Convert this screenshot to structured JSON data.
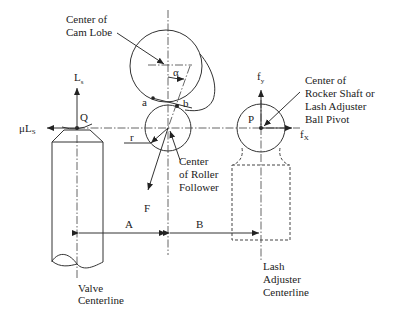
{
  "diagram": {
    "type": "rocker arm / roller follower valvetrain force diagram",
    "labels": {
      "cam_center": [
        "Center of",
        "Cam Lobe"
      ],
      "alpha": "α",
      "point_a": "a",
      "point_b": "b",
      "ls": "L",
      "ls_sub": "s",
      "q": "Q",
      "mu_ls": "μL",
      "mu_ls_sub": "S",
      "r": "r",
      "roller_center": [
        "Center",
        "of Roller",
        "Follower"
      ],
      "f": "F",
      "fy": "f",
      "fy_sub": "y",
      "fx": "f",
      "fx_sub": "X",
      "p": "P",
      "pivot_center": [
        "Center of",
        "Rocker Shaft or",
        "Lash Adjuster",
        "Ball Pivot"
      ],
      "dim_a": "A",
      "dim_b": "B",
      "valve_centerline": [
        "Valve",
        "Centerline"
      ],
      "lash_centerline": [
        "Lash",
        "Adjuster",
        "Centerline"
      ]
    },
    "colors": {
      "line": "#333333",
      "background": "#ffffff"
    }
  }
}
